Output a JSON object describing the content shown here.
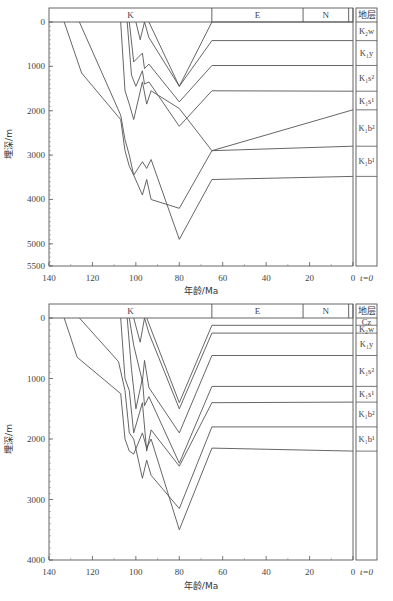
{
  "chart_data": [
    {
      "type": "line",
      "title": "",
      "xlabel": "年龄/Ma",
      "ylabel": "埋深/m",
      "xlim": [
        140,
        0
      ],
      "ylim": [
        0,
        5500
      ],
      "x_ticks": [
        "140",
        "120",
        "100",
        "80",
        "60",
        "40",
        "20",
        "0"
      ],
      "y_ticks": [
        "0",
        "1000",
        "2000",
        "3000",
        "4000",
        "5000",
        "5500"
      ],
      "period_bands": [
        {
          "label": "K",
          "from": 140,
          "to": 65
        },
        {
          "label": "E",
          "from": 65,
          "to": 23
        },
        {
          "label": "N",
          "from": 23,
          "to": 2
        }
      ],
      "strata_header": "地层",
      "strata": [
        {
          "label": "K₂w",
          "top": 0,
          "bottom": 420
        },
        {
          "label": "K₁y",
          "top": 420,
          "bottom": 980
        },
        {
          "label": "K₁s²",
          "top": 980,
          "bottom": 1560
        },
        {
          "label": "K₁s¹",
          "top": 1560,
          "bottom": 1980
        },
        {
          "label": "K₁b²",
          "top": 1980,
          "bottom": 2800
        },
        {
          "label": "K₁b¹",
          "top": 2800,
          "bottom": 3480
        }
      ],
      "time_marker": "t=0",
      "series": [
        {
          "name": "K₁b¹ base",
          "x": [
            133,
            125,
            107,
            105,
            103,
            101,
            97,
            95,
            93,
            80,
            65,
            0
          ],
          "y": [
            0,
            1150,
            2200,
            2900,
            3250,
            3450,
            3150,
            3300,
            3100,
            4900,
            3550,
            3480
          ]
        },
        {
          "name": "K₁b¹ top",
          "x": [
            126,
            107,
            105,
            103,
            101,
            97,
            95,
            93,
            80,
            65,
            0
          ],
          "y": [
            0,
            2100,
            2650,
            3000,
            3450,
            3900,
            3550,
            4000,
            4200,
            2900,
            2800
          ]
        },
        {
          "name": "K₁b² top",
          "x": [
            107,
            105,
            103,
            101,
            97,
            95,
            93,
            80,
            65,
            0
          ],
          "y": [
            0,
            1550,
            1850,
            2200,
            1350,
            1850,
            1550,
            1950,
            2900,
            1980
          ]
        },
        {
          "name": "K₁s¹ top",
          "x": [
            104,
            102,
            100,
            97,
            96,
            94,
            80,
            65,
            0
          ],
          "y": [
            0,
            1200,
            1450,
            1100,
            1400,
            1350,
            2350,
            1550,
            1560
          ]
        },
        {
          "name": "K₁s² top",
          "x": [
            103,
            101,
            97,
            96,
            94,
            80,
            65,
            0
          ],
          "y": [
            0,
            900,
            700,
            1050,
            950,
            1800,
            980,
            980
          ]
        },
        {
          "name": "K₁y top",
          "x": [
            100,
            98,
            96,
            94,
            80,
            65,
            0
          ],
          "y": [
            0,
            400,
            0,
            350,
            1450,
            420,
            420
          ]
        },
        {
          "name": "K₂w top",
          "x": [
            94,
            80,
            65,
            0
          ],
          "y": [
            0,
            1450,
            0,
            0
          ]
        }
      ]
    },
    {
      "type": "line",
      "title": "",
      "xlabel": "年龄/Ma",
      "ylabel": "埋深/m",
      "xlim": [
        140,
        0
      ],
      "ylim": [
        0,
        4000
      ],
      "x_ticks": [
        "140",
        "120",
        "100",
        "80",
        "60",
        "40",
        "20",
        "0"
      ],
      "y_ticks": [
        "0",
        "1000",
        "2000",
        "3000",
        "4000"
      ],
      "period_bands": [
        {
          "label": "K",
          "from": 140,
          "to": 65
        },
        {
          "label": "E",
          "from": 65,
          "to": 23
        },
        {
          "label": "N",
          "from": 23,
          "to": 2
        }
      ],
      "strata_header": "地层",
      "strata": [
        {
          "label": "Cz",
          "top": 0,
          "bottom": 120
        },
        {
          "label": "K₂w",
          "top": 120,
          "bottom": 250
        },
        {
          "label": "K₁y",
          "top": 250,
          "bottom": 620
        },
        {
          "label": "K₁s²",
          "top": 620,
          "bottom": 1130
        },
        {
          "label": "K₁s¹",
          "top": 1130,
          "bottom": 1390
        },
        {
          "label": "K₁b²",
          "top": 1390,
          "bottom": 1800
        },
        {
          "label": "K₁b¹",
          "top": 1800,
          "bottom": 2200
        }
      ],
      "time_marker": "t=0",
      "series": [
        {
          "name": "K₁b¹ base",
          "x": [
            133,
            127,
            107,
            105,
            103,
            101,
            97,
            95,
            93,
            80,
            65,
            0
          ],
          "y": [
            0,
            650,
            1250,
            2000,
            2200,
            2250,
            1900,
            2150,
            2000,
            3500,
            2150,
            2200
          ]
        },
        {
          "name": "K₁b¹ top",
          "x": [
            126,
            108,
            105,
            103,
            101,
            97,
            95,
            93,
            80,
            65,
            0
          ],
          "y": [
            0,
            720,
            1200,
            1900,
            2000,
            2650,
            2350,
            2600,
            3150,
            1800,
            1800
          ]
        },
        {
          "name": "K₁b² top",
          "x": [
            107,
            105,
            103,
            101,
            97,
            95,
            93,
            80,
            65,
            0
          ],
          "y": [
            0,
            1000,
            1200,
            1900,
            1400,
            2200,
            1850,
            2450,
            1400,
            1390
          ]
        },
        {
          "name": "K₁s¹ top",
          "x": [
            104,
            102,
            100,
            97,
            96,
            94,
            80,
            65,
            0
          ],
          "y": [
            0,
            850,
            1500,
            1000,
            1450,
            1300,
            2400,
            1130,
            1130
          ]
        },
        {
          "name": "K₁s² top",
          "x": [
            103,
            101,
            97,
            96,
            94,
            80,
            65,
            0
          ],
          "y": [
            0,
            450,
            1050,
            700,
            1150,
            1900,
            620,
            620
          ]
        },
        {
          "name": "K₁y top",
          "x": [
            101,
            98,
            96,
            94,
            80,
            65,
            0
          ],
          "y": [
            0,
            400,
            0,
            250,
            1500,
            250,
            250
          ]
        },
        {
          "name": "K₂w top",
          "x": [
            95,
            80,
            65,
            0
          ],
          "y": [
            0,
            1400,
            120,
            120
          ]
        }
      ]
    }
  ]
}
